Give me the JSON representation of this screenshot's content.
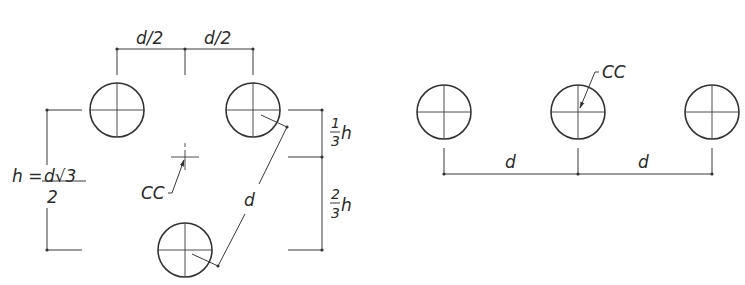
{
  "left_diagram": {
    "name": "triangular-arrangement",
    "top_dim_left": "d/2",
    "top_dim_right": "d/2",
    "height_formula": {
      "lhs": "h = ",
      "numerator": "d√3",
      "denominator": "2"
    },
    "right_dim_top": {
      "num": "1",
      "den": "3",
      "var": "h"
    },
    "right_dim_bottom": {
      "num": "2",
      "den": "3",
      "var": "h"
    },
    "diagonal_dim": "d",
    "centroid_label": "CC"
  },
  "right_diagram": {
    "name": "linear-arrangement",
    "centroid_label": "CC",
    "dim_left": "d",
    "dim_right": "d"
  },
  "colors": {
    "line": "#3a3a3a",
    "background": "#ffffff"
  }
}
